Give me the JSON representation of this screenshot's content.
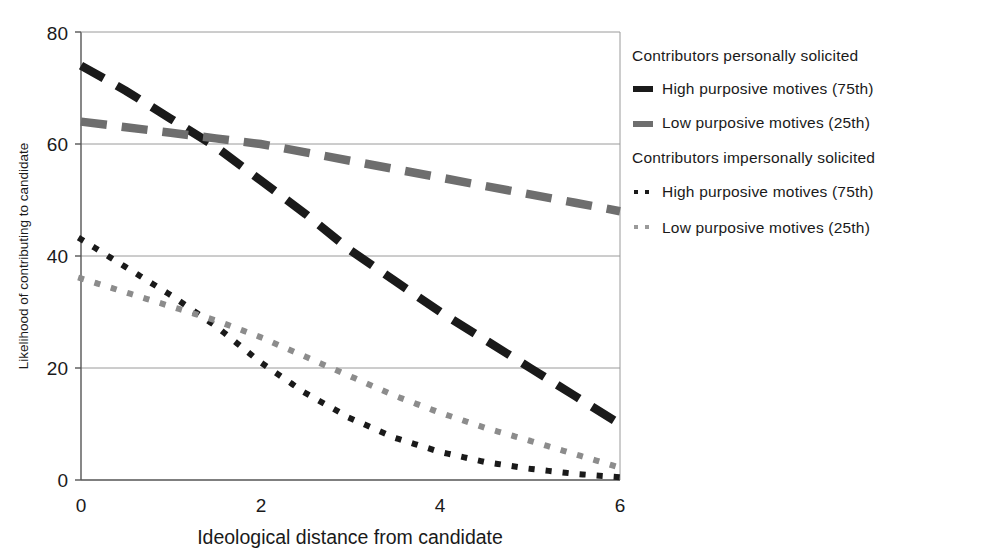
{
  "chart_data": {
    "type": "line",
    "title": "",
    "xlabel": "Ideological distance from candidate",
    "ylabel": "Likelihood of contributing to candidate",
    "xlim": [
      0,
      6
    ],
    "ylim": [
      0,
      80
    ],
    "xticks": [
      0,
      2,
      4,
      6
    ],
    "yticks": [
      0,
      20,
      40,
      60,
      80
    ],
    "xtick_labels": [
      "0",
      "2",
      "4",
      "6"
    ],
    "ytick_labels": [
      "0",
      "20",
      "40",
      "60",
      "80"
    ],
    "grid": "horizontal",
    "legend_position": "right",
    "x": [
      0,
      0.5,
      1,
      1.5,
      2,
      2.5,
      3,
      3.5,
      4,
      4.5,
      5,
      5.5,
      6
    ],
    "series": [
      {
        "name": "High purposive motives (75th)",
        "group": "Contributors personally solicited",
        "style": "dashed",
        "color": "#1a1a1a",
        "values": [
          74.0,
          69.5,
          64.5,
          59.5,
          53.5,
          47.5,
          41.0,
          35.5,
          30.0,
          25.0,
          20.0,
          15.0,
          10.0
        ]
      },
      {
        "name": "Low purposive motives (25th)",
        "group": "Contributors personally solicited",
        "style": "dashed",
        "color": "#6e6e6e",
        "values": [
          64.0,
          63.0,
          62.0,
          61.0,
          60.0,
          58.5,
          57.0,
          55.5,
          54.0,
          52.5,
          51.0,
          49.5,
          48.0
        ]
      },
      {
        "name": "High purposive motives (75th)",
        "group": "Contributors impersonally solicited",
        "style": "dotted",
        "color": "#1a1a1a",
        "values": [
          43.0,
          38.0,
          33.0,
          27.5,
          21.0,
          15.5,
          11.0,
          7.5,
          5.0,
          3.2,
          2.0,
          1.1,
          0.5
        ]
      },
      {
        "name": "Low purposive motives (25th)",
        "group": "Contributors impersonally solicited",
        "style": "dotted",
        "color": "#8c8c8c",
        "values": [
          36.0,
          33.5,
          31.0,
          28.5,
          25.5,
          22.0,
          18.5,
          15.0,
          12.0,
          9.3,
          7.0,
          4.6,
          2.2
        ]
      }
    ]
  },
  "legend": {
    "groups": [
      {
        "title": "Contributors personally solicited",
        "entries": [
          {
            "label": "High purposive motives (75th)",
            "marker": "dash-black-icon",
            "color": "#1a1a1a",
            "style": "dashed"
          },
          {
            "label": "Low purposive motives (25th)",
            "marker": "dash-gray-icon",
            "color": "#6e6e6e",
            "style": "dashed"
          }
        ]
      },
      {
        "title": "Contributors impersonally solicited",
        "entries": [
          {
            "label": "High purposive motives (75th)",
            "marker": "dots-black-icon",
            "color": "#1a1a1a",
            "style": "dotted"
          },
          {
            "label": "Low purposive motives (25th)",
            "marker": "dots-gray-icon",
            "color": "#9a9a9a",
            "style": "dotted"
          }
        ]
      }
    ]
  },
  "colors": {
    "axis": "#4d4d4d",
    "grid": "#8c8c8c",
    "text": "#1a1a1a",
    "background": "#ffffff",
    "series_black": "#1a1a1a",
    "series_gray": "#6e6e6e",
    "series_light_gray": "#8c8c8c"
  }
}
